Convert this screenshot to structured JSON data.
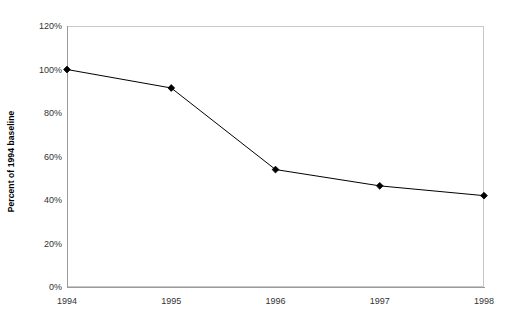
{
  "chart_data": {
    "type": "line",
    "title": "",
    "subtitle": "",
    "xlabel": "",
    "ylabel": "Percent of 1994 baseline",
    "categories": [
      "1994",
      "1995",
      "1996",
      "1997",
      "1998"
    ],
    "values": [
      100,
      91.5,
      54,
      46.5,
      42
    ],
    "series": [
      {
        "name": "Percent of 1994 baseline",
        "values": [
          100,
          91.5,
          54,
          46.5,
          42
        ]
      }
    ],
    "ylim": [
      0,
      120
    ],
    "ytick_labels": [
      "0%",
      "20%",
      "40%",
      "60%",
      "80%",
      "100%",
      "120%"
    ],
    "ytick_values": [
      0,
      20,
      40,
      60,
      80,
      100,
      120
    ],
    "xtick_labels": [
      "1994",
      "1995",
      "1996",
      "1997",
      "1998"
    ],
    "grid": false,
    "legend": "none",
    "marker": "diamond",
    "marker_color": "#000000",
    "line_color": "#000000",
    "plot_border_color": "#c8c8c8",
    "axis_color": "#9a9a9a",
    "background": "#ffffff"
  },
  "axis": {
    "y_title": "Percent of 1994 baseline"
  }
}
